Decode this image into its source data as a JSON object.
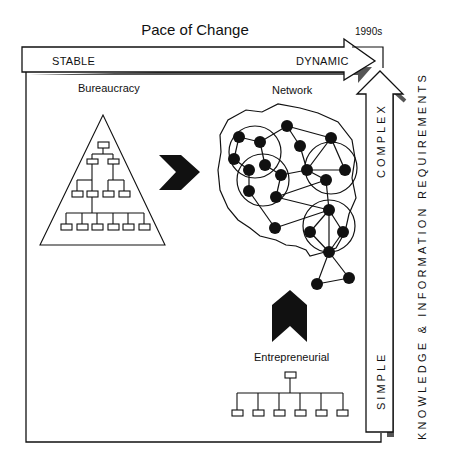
{
  "diagram": {
    "title": "Pace of Change",
    "era_label": "1990s",
    "horizontal_axis": {
      "left_label": "STABLE",
      "right_label": "DYNAMIC"
    },
    "vertical_axis": {
      "title": "KNOWLEDGE & INFORMATION REQUIREMENTS",
      "bottom_label": "SIMPLE",
      "top_label": "COMPLEX"
    },
    "structures": [
      {
        "name": "Bureaucracy",
        "shape": "pyramid-hierarchy"
      },
      {
        "name": "Network",
        "shape": "clustered-node-network"
      },
      {
        "name": "Entrepreneurial",
        "shape": "flat-hierarchy"
      }
    ],
    "transitions": [
      {
        "from": "Bureaucracy",
        "to": "Network",
        "arrow": "right-chevron"
      },
      {
        "from": "Entrepreneurial",
        "to": "Network",
        "arrow": "up-chevron"
      }
    ],
    "colors": {
      "ink": "#111111",
      "shadow": "#555555",
      "background": "#ffffff"
    }
  }
}
